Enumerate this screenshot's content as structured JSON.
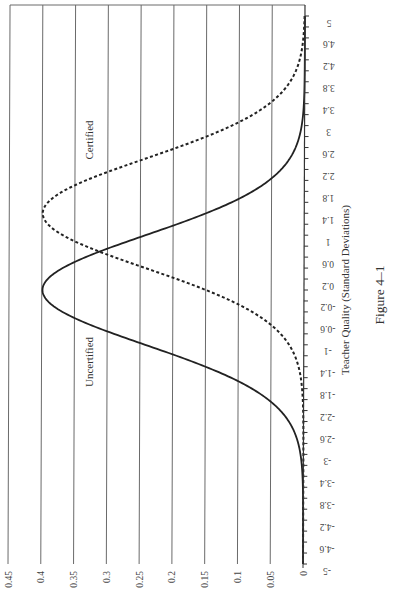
{
  "chart_data": {
    "type": "line",
    "title": "",
    "caption": "Figure 4–1",
    "xlabel": "Teacher Quality (Standard Deviations)",
    "ylabel": "",
    "xlim": [
      -5,
      5
    ],
    "ylim": [
      0,
      0.45
    ],
    "x_ticks": [
      "-5",
      "-4.6",
      "-4.2",
      "-3.8",
      "-3.4",
      "-3",
      "-2.6",
      "-2.2",
      "-1.8",
      "-1.4",
      "-1",
      "-0.6",
      "-0.2",
      "0.2",
      "0.6",
      "1",
      "1.4",
      "1.8",
      "2.2",
      "2.6",
      "3",
      "3.4",
      "3.8",
      "4.2",
      "4.6",
      "5"
    ],
    "y_ticks": [
      "0",
      "0.05",
      "0.1",
      "0.15",
      "0.2",
      "0.25",
      "0.3",
      "0.35",
      "0.4",
      "0.45"
    ],
    "grid": "horizontal gridlines at each y tick",
    "orientation": "figure rotated 90° counter-clockwise on page",
    "series": [
      {
        "name": "Uncertified",
        "style": "solid",
        "distribution": "normal",
        "mean": 0,
        "sd": 1,
        "x": [
          -5,
          -4,
          -3,
          -2.5,
          -2,
          -1.5,
          -1,
          -0.5,
          0,
          0.5,
          1,
          1.5,
          2,
          2.5,
          3,
          4,
          5
        ],
        "values": [
          0.0,
          0.0001,
          0.0044,
          0.0175,
          0.054,
          0.1295,
          0.242,
          0.3521,
          0.3989,
          0.3521,
          0.242,
          0.1295,
          0.054,
          0.0175,
          0.0044,
          0.0001,
          0.0
        ]
      },
      {
        "name": "Certified",
        "style": "dashed",
        "distribution": "normal",
        "mean": 1.4,
        "sd": 1,
        "x": [
          -5,
          -3,
          -2,
          -1.5,
          -1,
          -0.5,
          0,
          0.5,
          1,
          1.4,
          2,
          2.5,
          3,
          3.5,
          4,
          4.5,
          5
        ],
        "values": [
          0.0,
          0.0,
          0.0012,
          0.006,
          0.0224,
          0.0656,
          0.1497,
          0.2661,
          0.3683,
          0.3989,
          0.3332,
          0.2179,
          0.1109,
          0.044,
          0.0136,
          0.0033,
          0.0006
        ]
      }
    ],
    "annotations": [
      {
        "text": "Uncertified",
        "near_x": -1.4,
        "near_y": 0.33
      },
      {
        "text": "Certified",
        "near_x": 2.7,
        "near_y": 0.33
      }
    ]
  }
}
